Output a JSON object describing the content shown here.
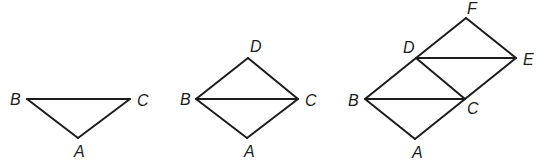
{
  "chart_data": null,
  "figures": [
    {
      "name": "triangle-ABC",
      "vertices": {
        "A": {
          "x": 78,
          "y": 138
        },
        "B": {
          "x": 27,
          "y": 99
        },
        "C": {
          "x": 130,
          "y": 99
        }
      },
      "labels": {
        "A": {
          "text": "A",
          "x": 74,
          "y": 157
        },
        "B": {
          "text": "B",
          "x": 10,
          "y": 105
        },
        "C": {
          "text": "C",
          "x": 137,
          "y": 106
        }
      },
      "edges": [
        [
          "B",
          "C"
        ],
        [
          "B",
          "A"
        ],
        [
          "C",
          "A"
        ]
      ]
    },
    {
      "name": "rhombus-ABDC",
      "vertices": {
        "A": {
          "x": 247,
          "y": 138
        },
        "B": {
          "x": 196,
          "y": 99
        },
        "C": {
          "x": 298,
          "y": 99
        },
        "D": {
          "x": 248,
          "y": 58
        }
      },
      "labels": {
        "A": {
          "text": "A",
          "x": 244,
          "y": 157
        },
        "B": {
          "text": "B",
          "x": 180,
          "y": 105
        },
        "C": {
          "text": "C",
          "x": 305,
          "y": 106
        },
        "D": {
          "text": "D",
          "x": 250,
          "y": 52
        }
      },
      "edges": [
        [
          "B",
          "C"
        ],
        [
          "B",
          "A"
        ],
        [
          "C",
          "A"
        ],
        [
          "B",
          "D"
        ],
        [
          "D",
          "C"
        ]
      ]
    },
    {
      "name": "parallelogram-ABCDEF",
      "vertices": {
        "A": {
          "x": 415,
          "y": 139
        },
        "B": {
          "x": 365,
          "y": 99
        },
        "C": {
          "x": 465,
          "y": 99
        },
        "D": {
          "x": 416,
          "y": 58
        },
        "E": {
          "x": 516,
          "y": 58
        },
        "F": {
          "x": 466,
          "y": 18
        }
      },
      "labels": {
        "A": {
          "text": "A",
          "x": 412,
          "y": 158
        },
        "B": {
          "text": "B",
          "x": 348,
          "y": 106
        },
        "C": {
          "text": "C",
          "x": 467,
          "y": 114
        },
        "D": {
          "text": "D",
          "x": 403,
          "y": 53
        },
        "E": {
          "text": "E",
          "x": 523,
          "y": 65
        },
        "F": {
          "text": "F",
          "x": 467,
          "y": 14
        }
      },
      "edges": [
        [
          "B",
          "C"
        ],
        [
          "B",
          "A"
        ],
        [
          "A",
          "C"
        ],
        [
          "B",
          "D"
        ],
        [
          "D",
          "C"
        ],
        [
          "C",
          "E"
        ],
        [
          "D",
          "E"
        ],
        [
          "D",
          "F"
        ],
        [
          "F",
          "E"
        ]
      ]
    }
  ]
}
